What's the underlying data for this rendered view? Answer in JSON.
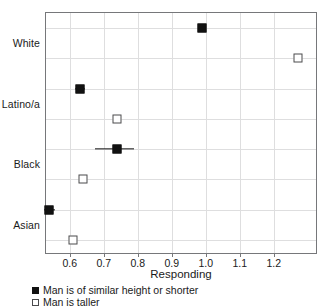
{
  "chart_data": {
    "type": "scatter",
    "title": "",
    "xlabel": "Responding",
    "ylabel": "",
    "xlim": [
      0.53,
      1.33
    ],
    "xticks": [
      0.6,
      0.7,
      0.8,
      0.9,
      1.0,
      1.1,
      1.2
    ],
    "xticklabels": [
      "0.6",
      "0.7",
      "0.8",
      "0.9",
      "1.0",
      "1.1",
      "1.2"
    ],
    "categories": [
      "White",
      "Latino/a",
      "Black",
      "Asian"
    ],
    "grid": true,
    "legend_position": "bottom-left",
    "series": [
      {
        "name": "Man is of similar height or shorter",
        "marker": "filled-square",
        "values": [
          0.99,
          0.63,
          0.74,
          0.54
        ],
        "errors_low": [
          0.98,
          0.615,
          0.675,
          0.525
        ],
        "errors_high": [
          1.0,
          0.645,
          0.79,
          0.555
        ]
      },
      {
        "name": "Man is taller",
        "marker": "open-square",
        "values": [
          1.27,
          0.74,
          0.64,
          0.61
        ],
        "errors_low": [
          1.27,
          0.74,
          0.64,
          0.61
        ],
        "errors_high": [
          1.27,
          0.74,
          0.64,
          0.61
        ]
      }
    ],
    "points": [
      {
        "label": "White",
        "series": "Man is of similar height or shorter",
        "value": 0.99,
        "row": 0,
        "marker": "filled-square",
        "err_low": 0.98,
        "err_high": 1.0
      },
      {
        "label": "White",
        "series": "Man is taller",
        "value": 1.27,
        "row": 1,
        "marker": "open-square",
        "err_low": 1.27,
        "err_high": 1.27
      },
      {
        "label": "Latino/a",
        "series": "Man is of similar height or shorter",
        "value": 0.63,
        "row": 2,
        "marker": "filled-square",
        "err_low": 0.615,
        "err_high": 0.645
      },
      {
        "label": "Latino/a",
        "series": "Man is taller",
        "value": 0.74,
        "row": 3,
        "marker": "open-square",
        "err_low": 0.74,
        "err_high": 0.74
      },
      {
        "label": "Black",
        "series": "Man is of similar height or shorter",
        "value": 0.74,
        "row": 4,
        "marker": "filled-square",
        "err_low": 0.675,
        "err_high": 0.79
      },
      {
        "label": "Black",
        "series": "Man is taller",
        "value": 0.64,
        "row": 5,
        "marker": "open-square",
        "err_low": 0.64,
        "err_high": 0.64
      },
      {
        "label": "Asian",
        "series": "Man is of similar height or shorter",
        "value": 0.54,
        "row": 6,
        "marker": "filled-square",
        "err_low": 0.525,
        "err_high": 0.555
      },
      {
        "label": "Asian",
        "series": "Man is taller",
        "value": 0.61,
        "row": 7,
        "marker": "open-square",
        "err_low": 0.61,
        "err_high": 0.61
      }
    ],
    "category_rows": [
      {
        "label": "White",
        "row": 0
      },
      {
        "label": "Latino/a",
        "row": 2
      },
      {
        "label": "Black",
        "row": 4
      },
      {
        "label": "Asian",
        "row": 6
      }
    ],
    "legend": [
      {
        "label": "Man is of similar height or shorter",
        "marker": "filled-square"
      },
      {
        "label": "Man is taller",
        "marker": "open-square"
      }
    ]
  },
  "colors": {
    "marker_fill": "#111111",
    "marker_open_border": "#4b4b4d",
    "grid": "#dededf",
    "frame": "#76777a",
    "text": "#1a1a1a",
    "background": "#ffffff"
  }
}
